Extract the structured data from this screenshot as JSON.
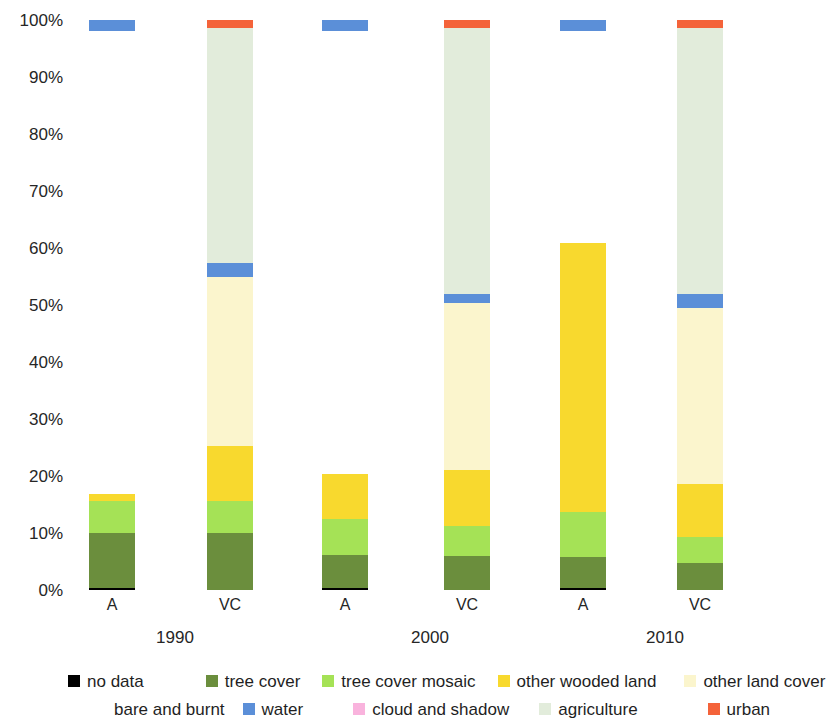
{
  "chart_data": {
    "type": "bar",
    "subtype": "stacked-percentage",
    "title": "",
    "xlabel": "",
    "ylabel": "",
    "ylim": [
      0,
      100
    ],
    "y_unit": "%",
    "grid": false,
    "legend_position": "bottom",
    "y_ticks": [
      "0%",
      "10%",
      "20%",
      "30%",
      "40%",
      "50%",
      "60%",
      "70%",
      "80%",
      "90%",
      "100%"
    ],
    "y_tick_values": [
      0,
      10,
      20,
      30,
      40,
      50,
      60,
      70,
      80,
      90,
      100
    ],
    "groups": [
      "1990",
      "2000",
      "2010"
    ],
    "categories": [
      "A",
      "VC",
      "A",
      "VC",
      "A",
      "VC"
    ],
    "series": [
      {
        "name": "no data",
        "key": "no_data",
        "color": "#000000",
        "values": [
          0.4,
          0.0,
          0.4,
          0.0,
          0.4,
          0.0
        ]
      },
      {
        "name": "tree cover",
        "key": "tree_cover",
        "color": "#6b8e3d",
        "values": [
          10.0,
          10.0,
          6.1,
          6.0,
          5.8,
          4.7
        ]
      },
      {
        "name": "tree cover mosaic",
        "key": "tree_cover_mosaic",
        "color": "#a5e256",
        "values": [
          5.5,
          5.6,
          6.4,
          5.2,
          7.9,
          4.6
        ]
      },
      {
        "name": "other wooded land",
        "key": "other_wooded_land",
        "color": "#f8d92e",
        "values": [
          1.3,
          9.3,
          7.8,
          9.8,
          47.2,
          9.3
        ]
      },
      {
        "name": "other land cover",
        "key": "other_land_cover",
        "color": "#fbf5cd",
        "values": [
          0.0,
          29.9,
          0.0,
          30.3,
          0.0,
          32.5
        ]
      },
      {
        "name": "bare and burnt",
        "key": "bare_and_burnt",
        "color": "#ffffff",
        "values": [
          0.0,
          0.0,
          0.0,
          0.0,
          0.0,
          0.0
        ]
      },
      {
        "name": "water",
        "key": "water",
        "color": "#5b8fd8",
        "values": [
          2.0,
          2.5,
          2.0,
          2.6,
          2.0,
          2.6
        ]
      },
      {
        "name": "cloud and shadow",
        "key": "cloud_and_shadow",
        "color": "#f9b3dd",
        "values": [
          0.0,
          0.0,
          0.0,
          0.0,
          0.0,
          0.0
        ]
      },
      {
        "name": "agriculture",
        "key": "agriculture",
        "color": "#e2ecdb",
        "values": [
          0.0,
          41.3,
          0.0,
          44.7,
          0.0,
          45.1
        ]
      },
      {
        "name": "urban",
        "key": "urban",
        "color": "#f4633a",
        "values": [
          0.0,
          1.4,
          0.0,
          1.4,
          0.0,
          1.4
        ]
      }
    ],
    "bars": [
      {
        "label": "A",
        "group": "1990",
        "stack": [
          {
            "key": "no_data",
            "from": 0.0,
            "to": 0.4
          },
          {
            "key": "tree_cover",
            "from": 0.4,
            "to": 10.0
          },
          {
            "key": "tree_cover_mosaic",
            "from": 10.0,
            "to": 15.6
          },
          {
            "key": "other_wooded_land",
            "from": 15.6,
            "to": 16.8
          }
        ],
        "floating": [
          {
            "key": "water",
            "from": 98.0,
            "to": 100.0
          }
        ]
      },
      {
        "label": "VC",
        "group": "1990",
        "stack": [
          {
            "key": "tree_cover",
            "from": 0.0,
            "to": 10.0
          },
          {
            "key": "tree_cover_mosaic",
            "from": 10.0,
            "to": 15.6
          },
          {
            "key": "other_wooded_land",
            "from": 15.6,
            "to": 25.3
          },
          {
            "key": "other_land_cover",
            "from": 25.3,
            "to": 54.9
          },
          {
            "key": "water",
            "from": 54.9,
            "to": 57.4
          },
          {
            "key": "agriculture",
            "from": 57.4,
            "to": 98.6
          },
          {
            "key": "urban",
            "from": 98.6,
            "to": 100.0
          }
        ],
        "floating": []
      },
      {
        "label": "A",
        "group": "2000",
        "stack": [
          {
            "key": "no_data",
            "from": 0.0,
            "to": 0.4
          },
          {
            "key": "tree_cover",
            "from": 0.4,
            "to": 6.1
          },
          {
            "key": "tree_cover_mosaic",
            "from": 6.1,
            "to": 12.5
          },
          {
            "key": "other_wooded_land",
            "from": 12.5,
            "to": 20.4
          }
        ],
        "floating": [
          {
            "key": "water",
            "from": 98.0,
            "to": 100.0
          }
        ]
      },
      {
        "label": "VC",
        "group": "2000",
        "stack": [
          {
            "key": "tree_cover",
            "from": 0.0,
            "to": 6.0
          },
          {
            "key": "tree_cover_mosaic",
            "from": 6.0,
            "to": 11.2
          },
          {
            "key": "other_wooded_land",
            "from": 11.2,
            "to": 21.1
          },
          {
            "key": "other_land_cover",
            "from": 21.1,
            "to": 50.3
          },
          {
            "key": "water",
            "from": 50.3,
            "to": 52.0
          },
          {
            "key": "agriculture",
            "from": 52.0,
            "to": 98.6
          },
          {
            "key": "urban",
            "from": 98.6,
            "to": 100.0
          }
        ],
        "floating": []
      },
      {
        "label": "A",
        "group": "2010",
        "stack": [
          {
            "key": "no_data",
            "from": 0.0,
            "to": 0.4
          },
          {
            "key": "tree_cover",
            "from": 0.4,
            "to": 5.8
          },
          {
            "key": "tree_cover_mosaic",
            "from": 5.8,
            "to": 13.7
          },
          {
            "key": "other_wooded_land",
            "from": 13.7,
            "to": 60.9
          }
        ],
        "floating": [
          {
            "key": "water",
            "from": 98.0,
            "to": 100.0
          }
        ]
      },
      {
        "label": "VC",
        "group": "2010",
        "stack": [
          {
            "key": "tree_cover",
            "from": 0.0,
            "to": 4.7
          },
          {
            "key": "tree_cover_mosaic",
            "from": 4.7,
            "to": 9.3
          },
          {
            "key": "other_wooded_land",
            "from": 9.3,
            "to": 18.6
          },
          {
            "key": "other_land_cover",
            "from": 18.6,
            "to": 49.4
          },
          {
            "key": "water",
            "from": 49.4,
            "to": 52.0
          },
          {
            "key": "agriculture",
            "from": 52.0,
            "to": 98.6
          },
          {
            "key": "urban",
            "from": 98.6,
            "to": 100.0
          }
        ],
        "floating": []
      }
    ],
    "legend": [
      {
        "label": "no data",
        "color": "#000000",
        "row": 1
      },
      {
        "label": "tree cover",
        "color": "#6b8e3d",
        "row": 1
      },
      {
        "label": "tree cover mosaic",
        "color": "#a5e256",
        "row": 1
      },
      {
        "label": "other wooded land",
        "color": "#f8d92e",
        "row": 1
      },
      {
        "label": "other land cover",
        "color": "#fbf5cd",
        "row": 1
      },
      {
        "label": "bare and burnt",
        "color": "#ffffff",
        "row": 2
      },
      {
        "label": "water",
        "color": "#5b8fd8",
        "row": 2
      },
      {
        "label": "cloud and shadow",
        "color": "#f9b3dd",
        "row": 2
      },
      {
        "label": "agriculture",
        "color": "#e2ecdb",
        "row": 2
      },
      {
        "label": "urban",
        "color": "#f4633a",
        "row": 2
      }
    ]
  },
  "layout": {
    "bar_centers": [
      112,
      230,
      345,
      467,
      583,
      700
    ],
    "bar_width": 46,
    "group_label_centers": [
      175,
      430,
      665
    ]
  }
}
